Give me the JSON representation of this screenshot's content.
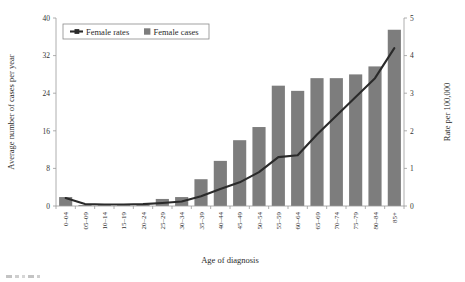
{
  "chart_data": {
    "type": "bar",
    "title": "",
    "xlabel": "Age of diagnosis",
    "ylabel": "Average number of cases per year",
    "y2label": "Rate per 100,000",
    "grid": false,
    "legend_position": "top-left-inside",
    "categories": [
      "0–04",
      "05–09",
      "10–14",
      "15–19",
      "20–24",
      "25–29",
      "30–34",
      "35–39",
      "40–44",
      "45–49",
      "50–54",
      "55–59",
      "60–64",
      "65–69",
      "70–74",
      "75–79",
      "80–84",
      "85+"
    ],
    "ylim": [
      0,
      40
    ],
    "yticks": [
      "0",
      "8",
      "16",
      "24",
      "32",
      "40"
    ],
    "y2lim": [
      0,
      5
    ],
    "y2ticks": [
      "0",
      "1",
      "2",
      "3",
      "4",
      "5"
    ],
    "series": [
      {
        "name": "Female cases",
        "type": "bar",
        "axis": "left",
        "color": "#7d7d7d",
        "values": [
          1.9,
          0.2,
          0.2,
          0.2,
          0.3,
          1.5,
          1.9,
          5.7,
          9.6,
          14.0,
          16.8,
          25.6,
          24.5,
          27.2,
          27.2,
          28.0,
          29.7,
          37.5
        ]
      },
      {
        "name": "Female rates",
        "type": "line",
        "axis": "right",
        "color": "#2a2a2a",
        "values": [
          0.21,
          0.05,
          0.04,
          0.04,
          0.05,
          0.08,
          0.12,
          0.26,
          0.45,
          0.63,
          0.9,
          1.3,
          1.35,
          1.9,
          2.4,
          2.9,
          3.4,
          4.2
        ]
      }
    ],
    "legend": [
      {
        "label": "Female rates",
        "marker": "line",
        "color": "#2a2a2a"
      },
      {
        "label": "Female cases",
        "marker": "square",
        "color": "#7d7d7d"
      }
    ]
  }
}
